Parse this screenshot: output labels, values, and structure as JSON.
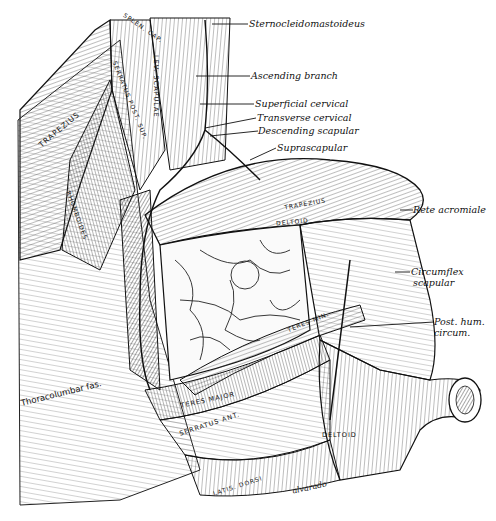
{
  "figure": {
    "style": "black and white engraving",
    "signature": "alvarado"
  },
  "labels": [
    {
      "id": "sternocleidomastoideus",
      "text": "Sternocleidomastoideus"
    },
    {
      "id": "ascending-branch",
      "text": "Ascending branch"
    },
    {
      "id": "superficial-cervical",
      "text": "Superficial cervical"
    },
    {
      "id": "transverse-cervical",
      "text": "Transverse cervical"
    },
    {
      "id": "descending-scapular",
      "text": "Descending scapular"
    },
    {
      "id": "suprascapular",
      "text": "Suprascapular"
    },
    {
      "id": "rete-acromiale",
      "text": "Rete acromiale"
    },
    {
      "id": "circumflex-scapular-1",
      "text": "Circumflex"
    },
    {
      "id": "circumflex-scapular-2",
      "text": "scapular"
    },
    {
      "id": "post-hum-circum-1",
      "text": "Post. hum."
    },
    {
      "id": "post-hum-circum-2",
      "text": "circum."
    },
    {
      "id": "thoracolumbar-fas",
      "text": "Thoracolumbar fas."
    }
  ],
  "muscle_labels": {
    "splen_cap": "SPLEN. CAP.",
    "lev_scapulae": "LEV. SCAPULAE",
    "serratus_post_sup": "SERRATUS POST. SUP.",
    "trapezius_left": "TRAPEZIUS",
    "rhomboides": "RHOMBOIDES",
    "trapezius_right": "TRAPEZIUS",
    "deltoid_upper": "DELTOID",
    "teres_min": "TERES MIN.",
    "teres_major": "TERES MAJOR",
    "serratus_ant": "SERRATUS ANT.",
    "latis_dorsi": "LATIS. DORSI",
    "deltoid_lower": "DELTOID"
  },
  "colors": {
    "ink": "#111111",
    "paper": "#ffffff",
    "hatch": "#555555"
  }
}
